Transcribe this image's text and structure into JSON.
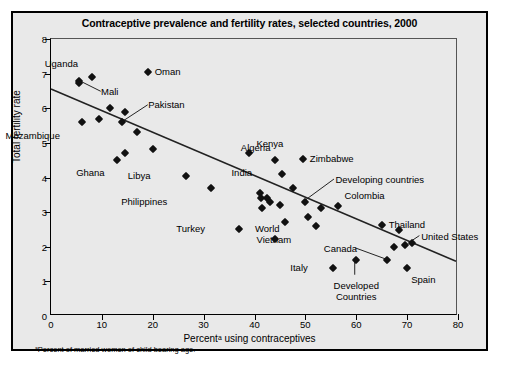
{
  "chart_data": {
    "type": "scatter",
    "title": "Contraceptive prevalence and fertility rates, selected countries, 2000",
    "xlabel": "Percentᵃ using contraceptives",
    "ylabel": "Total fertility rate",
    "xlim": [
      0,
      80
    ],
    "ylim": [
      0,
      8
    ],
    "xticks": [
      0,
      10,
      20,
      30,
      40,
      50,
      60,
      70,
      80
    ],
    "yticks": [
      0,
      1,
      2,
      3,
      4,
      5,
      6,
      7,
      8
    ],
    "grid": false,
    "legend": "none",
    "footnote": "ᵃPercent of married women of child bearing age.",
    "trendline": {
      "x0": 0,
      "y0": 6.55,
      "x1": 80,
      "y1": 1.55
    },
    "points": [
      {
        "label": "Mali",
        "x": 5.5,
        "y": 6.8,
        "label_dx": 22,
        "label_dy": 11,
        "leader": true
      },
      {
        "label": "",
        "x": 5.6,
        "y": 6.72,
        "label_dx": 0,
        "label_dy": 0,
        "leader": false
      },
      {
        "label": "Uganda",
        "x": 8.0,
        "y": 6.9,
        "label_dx": -14,
        "label_dy": -13,
        "leader": false
      },
      {
        "label": "Oman",
        "x": 19.0,
        "y": 7.05,
        "label_dx": 7,
        "label_dy": 0,
        "leader": false
      },
      {
        "label": "Mozambique",
        "x": 6.0,
        "y": 5.6,
        "label_dx": -22,
        "label_dy": 14,
        "leader": false
      },
      {
        "label": "",
        "x": 9.5,
        "y": 5.7,
        "label_dx": 0,
        "label_dy": 0,
        "leader": false
      },
      {
        "label": "",
        "x": 11.5,
        "y": 6.0,
        "label_dx": 0,
        "label_dy": 0,
        "leader": false
      },
      {
        "label": "",
        "x": 14.5,
        "y": 5.9,
        "label_dx": 0,
        "label_dy": 0,
        "leader": false
      },
      {
        "label": "Pakistan",
        "x": 14.0,
        "y": 5.6,
        "label_dx": 26,
        "label_dy": -17,
        "leader": true
      },
      {
        "label": "",
        "x": 17.0,
        "y": 5.3,
        "label_dx": 0,
        "label_dy": 0,
        "leader": false
      },
      {
        "label": "Ghana",
        "x": 13.0,
        "y": 4.5,
        "label_dx": -12,
        "label_dy": 13,
        "leader": false
      },
      {
        "label": "",
        "x": 14.5,
        "y": 4.72,
        "label_dx": 0,
        "label_dy": 0,
        "leader": false
      },
      {
        "label": "",
        "x": 20.0,
        "y": 4.82,
        "label_dx": 0,
        "label_dy": 0,
        "leader": false
      },
      {
        "label": "Libya",
        "x": 26.5,
        "y": 4.05,
        "label_dx": -35,
        "label_dy": 0,
        "leader": false
      },
      {
        "label": "Philippines",
        "x": 31.5,
        "y": 3.7,
        "label_dx": -44,
        "label_dy": 14,
        "leader": false
      },
      {
        "label": "Kenya",
        "x": 39.0,
        "y": 4.72,
        "label_dx": 7,
        "label_dy": -9,
        "leader": false
      },
      {
        "label": "Algeria",
        "x": 44.0,
        "y": 4.5,
        "label_dx": -4,
        "label_dy": -12,
        "leader": false
      },
      {
        "label": "Zimbabwe",
        "x": 49.5,
        "y": 4.52,
        "label_dx": 7,
        "label_dy": 0,
        "leader": false
      },
      {
        "label": "India",
        "x": 45.5,
        "y": 4.1,
        "label_dx": -30,
        "label_dy": -1,
        "leader": false
      },
      {
        "label": "",
        "x": 47.5,
        "y": 3.7,
        "label_dx": 0,
        "label_dy": 0,
        "leader": false
      },
      {
        "label": "Developing countries",
        "x": 50.0,
        "y": 3.3,
        "label_dx": 30,
        "label_dy": -22,
        "leader": true
      },
      {
        "label": "",
        "x": 41.0,
        "y": 3.55,
        "label_dx": 0,
        "label_dy": 0,
        "leader": false
      },
      {
        "label": "",
        "x": 41.3,
        "y": 3.4,
        "label_dx": 0,
        "label_dy": 0,
        "leader": false
      },
      {
        "label": "",
        "x": 42.5,
        "y": 3.42,
        "label_dx": 0,
        "label_dy": 0,
        "leader": false
      },
      {
        "label": "",
        "x": 43.0,
        "y": 3.3,
        "label_dx": 0,
        "label_dy": 0,
        "leader": false
      },
      {
        "label": "",
        "x": 41.5,
        "y": 3.12,
        "label_dx": 0,
        "label_dy": 0,
        "leader": false
      },
      {
        "label": "",
        "x": 45.0,
        "y": 3.2,
        "label_dx": 0,
        "label_dy": 0,
        "leader": false
      },
      {
        "label": "Colombia",
        "x": 56.5,
        "y": 3.18,
        "label_dx": 6,
        "label_dy": -10,
        "leader": false
      },
      {
        "label": "",
        "x": 53.0,
        "y": 3.12,
        "label_dx": 0,
        "label_dy": 0,
        "leader": false
      },
      {
        "label": "World",
        "x": 50.5,
        "y": 2.85,
        "label_dx": -28,
        "label_dy": 12,
        "leader": false
      },
      {
        "label": "",
        "x": 46.0,
        "y": 2.72,
        "label_dx": 0,
        "label_dy": 0,
        "leader": false
      },
      {
        "label": "Vietnam",
        "x": 52.0,
        "y": 2.6,
        "label_dx": -24,
        "label_dy": 14,
        "leader": false
      },
      {
        "label": "Turkey",
        "x": 37.0,
        "y": 2.5,
        "label_dx": -34,
        "label_dy": 0,
        "leader": false
      },
      {
        "label": "",
        "x": 44.0,
        "y": 2.22,
        "label_dx": 0,
        "label_dy": 0,
        "leader": false
      },
      {
        "label": "Thailand",
        "x": 65.0,
        "y": 2.62,
        "label_dx": 7,
        "label_dy": 0,
        "leader": false
      },
      {
        "label": "",
        "x": 68.5,
        "y": 2.48,
        "label_dx": 0,
        "label_dy": 0,
        "leader": false
      },
      {
        "label": "United States",
        "x": 71.0,
        "y": 2.12,
        "label_dx": 9,
        "label_dy": -6,
        "leader": true
      },
      {
        "label": "",
        "x": 69.5,
        "y": 2.05,
        "label_dx": 0,
        "label_dy": 0,
        "leader": false
      },
      {
        "label": "",
        "x": 67.5,
        "y": 2.0,
        "label_dx": 0,
        "label_dy": 0,
        "leader": false
      },
      {
        "label": "Canada",
        "x": 66.0,
        "y": 1.62,
        "label_dx": -30,
        "label_dy": -11,
        "leader": true
      },
      {
        "label": "Developed Countries",
        "x": 60.0,
        "y": 1.62,
        "label_dx": -18,
        "label_dy": 26,
        "leader": true
      },
      {
        "label": "Italy",
        "x": 55.5,
        "y": 1.4,
        "label_dx": -26,
        "label_dy": 0,
        "leader": false
      },
      {
        "label": "Spain",
        "x": 70.0,
        "y": 1.38,
        "label_dx": 4,
        "label_dy": 12,
        "leader": false
      }
    ]
  }
}
